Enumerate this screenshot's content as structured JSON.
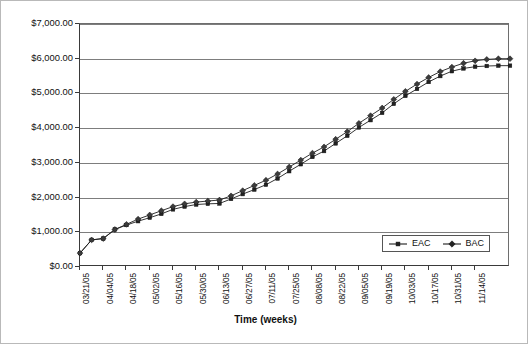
{
  "chart_data": {
    "type": "line",
    "title": "",
    "xlabel": "Time (weeks)",
    "ylabel": "",
    "ylim": [
      0,
      7000
    ],
    "ytick_values": [
      0,
      1000,
      2000,
      3000,
      4000,
      5000,
      6000,
      7000
    ],
    "ytick_labels": [
      "$0.00",
      "$1,000.00",
      "$2,000.00",
      "$3,000.00",
      "$4,000.00",
      "$5,000.00",
      "$6,000.00",
      "$7,000.00"
    ],
    "grid": true,
    "grid_axis": "y",
    "legend_position": "lower right",
    "xtick_labels": [
      "03/21/05",
      "04/04/05",
      "04/18/05",
      "05/02/05",
      "05/16/05",
      "05/30/05",
      "06/13/05",
      "06/27/05",
      "07/11/05",
      "07/25/05",
      "08/08/05",
      "08/22/05",
      "09/05/05",
      "09/19/05",
      "10/03/05",
      "10/17/05",
      "10/31/05",
      "11/14/05"
    ],
    "xtick_label_rotation": 90,
    "x_interval_weeks": 2,
    "point_interval_weeks": 1,
    "series": [
      {
        "name": "EAC",
        "marker": "square",
        "color": "#222222",
        "values": [
          400,
          780,
          820,
          1080,
          1210,
          1320,
          1420,
          1530,
          1660,
          1740,
          1800,
          1820,
          1830,
          1960,
          2100,
          2230,
          2370,
          2550,
          2760,
          2960,
          3170,
          3340,
          3560,
          3780,
          4020,
          4230,
          4440,
          4700,
          4930,
          5130,
          5330,
          5500,
          5640,
          5720,
          5770,
          5790,
          5800,
          5800
        ]
      },
      {
        "name": "BAC",
        "marker": "diamond",
        "color": "#3b3b3b",
        "values": [
          400,
          780,
          820,
          1080,
          1230,
          1380,
          1500,
          1620,
          1740,
          1820,
          1870,
          1900,
          1930,
          2050,
          2200,
          2350,
          2500,
          2680,
          2880,
          3080,
          3280,
          3460,
          3680,
          3900,
          4140,
          4360,
          4580,
          4830,
          5060,
          5270,
          5460,
          5630,
          5760,
          5870,
          5940,
          5980,
          6000,
          6000
        ]
      }
    ]
  },
  "legend": {
    "entries": [
      {
        "label": "EAC",
        "marker": "square"
      },
      {
        "label": "BAC",
        "marker": "diamond"
      }
    ]
  }
}
